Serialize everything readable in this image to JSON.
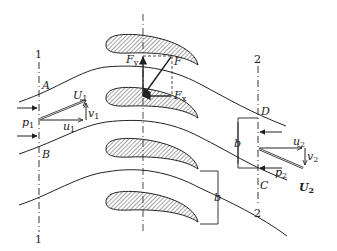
{
  "diagram": {
    "stations": {
      "inlet": "1",
      "outlet": "2"
    },
    "points": {
      "A": "A",
      "B": "B",
      "C": "C",
      "D": "D"
    },
    "forces": {
      "F": "F",
      "Fy": "F",
      "Fy_sub": "y",
      "Fx": "F",
      "Fx_sub": "x"
    },
    "inlet_vectors": {
      "U": "U",
      "U_sub": "1",
      "u": "u",
      "u_sub": "1",
      "v": "v",
      "v_sub": "1",
      "p": "p",
      "p_sub": "1"
    },
    "outlet_vectors": {
      "U": "U",
      "U_sub": "2",
      "u": "u",
      "u_sub": "2",
      "v": "v",
      "v_sub": "2",
      "p": "p",
      "p_sub": "2"
    },
    "spacing_label": "b",
    "colors": {
      "ink": "#222222",
      "background": "#ffffff"
    }
  }
}
